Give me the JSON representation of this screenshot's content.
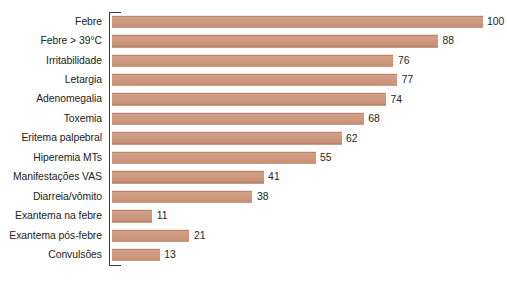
{
  "chart_data": {
    "type": "bar",
    "orientation": "horizontal",
    "title": "",
    "subtitle": "",
    "xlabel": "",
    "ylabel": "",
    "xlim": [
      0,
      100
    ],
    "grid": false,
    "legend": null,
    "bar_color": "#cd9a80",
    "bar_edge_color": "#b9846b",
    "axis_color": "#3a3a3a",
    "background_color": "#ffffff",
    "value_label_color": "#1e1e1e",
    "category_label_color": "#222222",
    "show_value_labels": true,
    "categories": [
      "Febre",
      "Febre > 39°C",
      "Irritabilidade",
      "Letargia",
      "Adenomegalia",
      "Toxemia",
      "Eritema palpebral",
      "Hiperemia MTs",
      "Manifestações VAS",
      "Diarreia/vômito",
      "Exantema na febre",
      "Exantema pós-febre",
      "Convulsões"
    ],
    "values": [
      100,
      88,
      76,
      77,
      74,
      68,
      62,
      55,
      41,
      38,
      11,
      21,
      13
    ],
    "value_labels": [
      "100",
      "88",
      "76",
      "77",
      "74",
      "68",
      "62",
      "55",
      "41",
      "38",
      "11",
      "21",
      "13"
    ]
  }
}
